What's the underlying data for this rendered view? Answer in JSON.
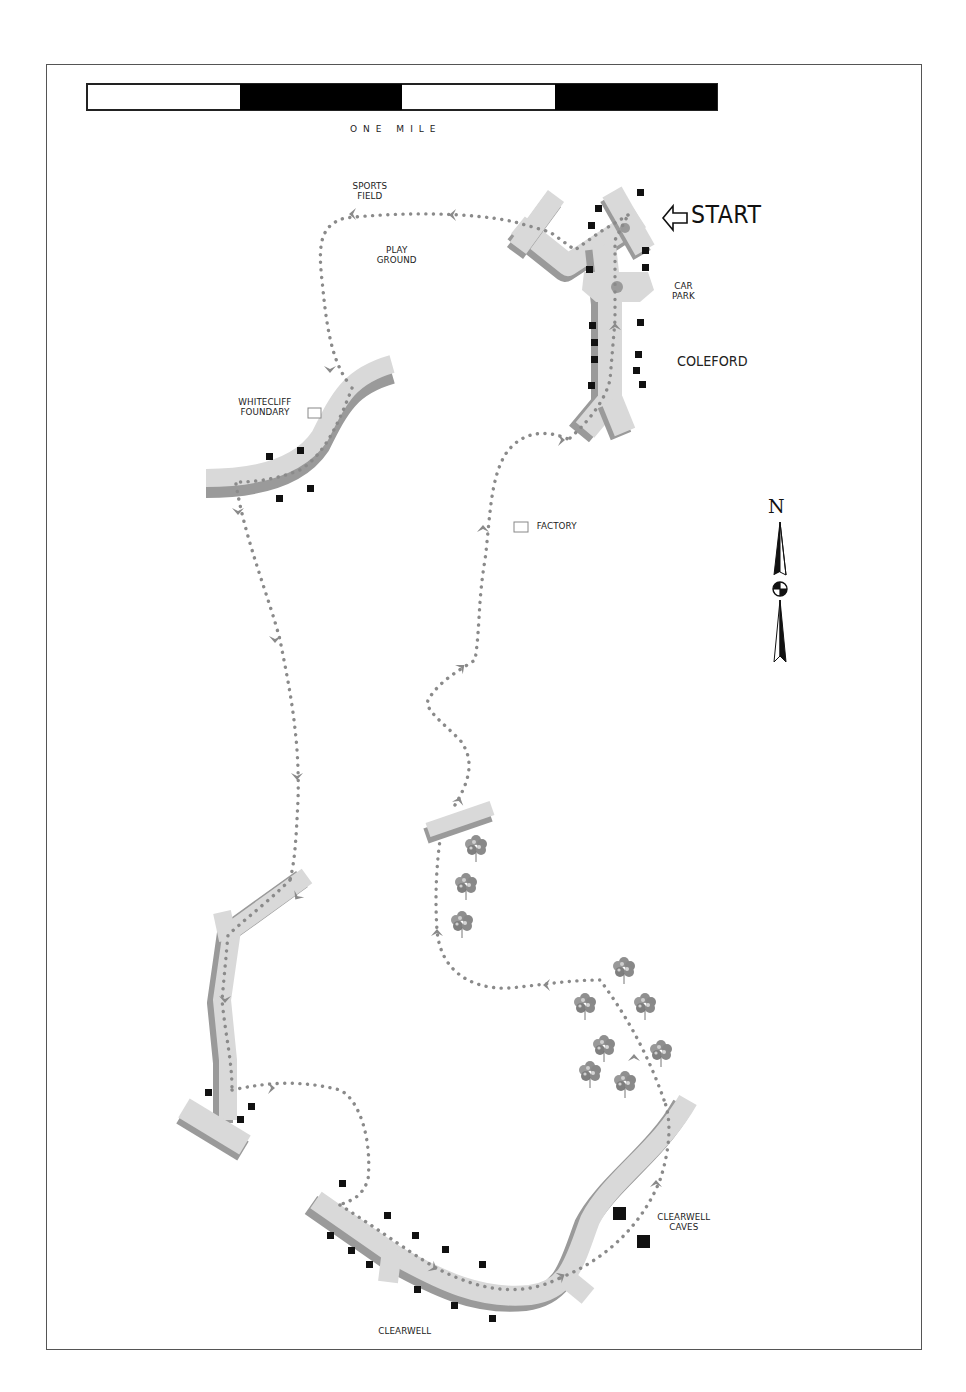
{
  "map": {
    "title": "Coleford – Clearwell walk route",
    "scale_bar": {
      "caption": "ONE MILE",
      "segments": [
        "white",
        "black",
        "white",
        "black"
      ]
    },
    "start_marker": {
      "label": "START",
      "icon": "hollow-arrow-left-icon"
    },
    "north_arrow": {
      "label": "N",
      "icon": "north-arrow-icon"
    },
    "places": {
      "sports_field": {
        "line1": "SPORTS",
        "line2": "FIELD"
      },
      "play_ground": {
        "line1": "PLAY",
        "line2": "GROUND"
      },
      "car_park": {
        "line1": "CAR",
        "line2": "PARK"
      },
      "coleford": "COLEFORD",
      "whitecliff": {
        "line1": "WHITECLIFF",
        "line2": "FOUNDARY"
      },
      "factory": "FACTORY",
      "clearwell_caves": {
        "line1": "CLEARWELL",
        "line2": "CAVES"
      },
      "clearwell": "CLEARWELL"
    },
    "colors": {
      "road_fill": "#d9d9d9",
      "road_shadow": "#9a9a9a",
      "route_dots": "#8a8a8a",
      "building": "#111111",
      "frame": "#555555"
    },
    "legend_symbols": {
      "route": "dotted-route-line",
      "buildings": "black-square-icon",
      "landmark": "hollow-square-icon",
      "woodland": "tree-icon"
    }
  }
}
